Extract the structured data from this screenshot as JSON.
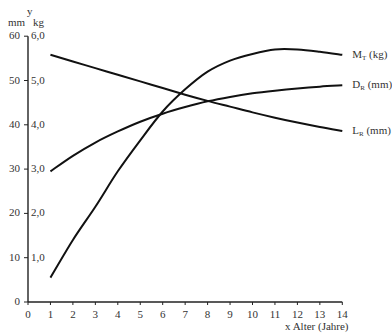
{
  "chart_data": {
    "type": "line",
    "title": "",
    "xlabel": "Alter (Jahre)",
    "x_axis_letter": "x",
    "y_axis_letter": "y",
    "ylabel_left_unit": "mm",
    "ylabel_right_unit": "kg",
    "xlim": [
      0,
      14
    ],
    "ylim": [
      0,
      60
    ],
    "x_ticks": [
      "0",
      "1",
      "2",
      "3",
      "4",
      "5",
      "6",
      "7",
      "8",
      "9",
      "10",
      "11",
      "12",
      "13",
      "14"
    ],
    "y_ticks_mm": [
      "0",
      "10",
      "20",
      "30",
      "40",
      "50",
      "60"
    ],
    "y_ticks_kg": [
      "",
      "1,0",
      "2,0",
      "3,0",
      "4,0",
      "5,0",
      "6,0"
    ],
    "grid": false,
    "legend_position": "inline-right-end-of-lines",
    "x": [
      1,
      2,
      3,
      4,
      5,
      6,
      7,
      8,
      9,
      10,
      11,
      12,
      13,
      14
    ],
    "series": [
      {
        "name": "M_T (kg)",
        "label_main": "M",
        "label_sub": "T",
        "label_unit": "(kg)",
        "unit": "kg",
        "values": [
          0.55,
          1.4,
          2.15,
          2.95,
          3.65,
          4.3,
          4.8,
          5.2,
          5.45,
          5.6,
          5.7,
          5.7,
          5.65,
          5.58
        ]
      },
      {
        "name": "D_R (mm)",
        "label_main": "D",
        "label_sub": "R",
        "label_unit": "(mm)",
        "unit": "mm",
        "values": [
          29.5,
          33,
          36,
          38.5,
          40.7,
          42.5,
          44,
          45.3,
          46.3,
          47.1,
          47.7,
          48.2,
          48.6,
          48.9
        ]
      },
      {
        "name": "L_R (mm)",
        "label_main": "L",
        "label_sub": "R",
        "label_unit": "(mm)",
        "unit": "mm",
        "values": [
          55.8,
          54.3,
          52.8,
          51.3,
          49.8,
          48.3,
          46.8,
          45.4,
          44.1,
          42.8,
          41.6,
          40.5,
          39.5,
          38.6
        ]
      }
    ]
  }
}
